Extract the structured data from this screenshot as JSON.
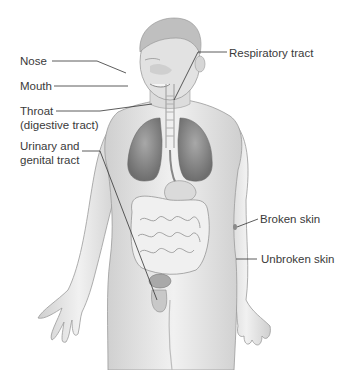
{
  "figure": {
    "labels": {
      "nose": "Nose",
      "mouth": "Mouth",
      "throat_line1": "Throat",
      "throat_line2": "(digestive tract)",
      "urinary_line1": "Urinary and",
      "urinary_line2": "genital tract",
      "respiratory": "Respiratory tract",
      "broken_skin": "Broken skin",
      "unbroken_skin": "Unbroken skin"
    },
    "colors": {
      "skin": "#e6e6e6",
      "skin_shadow": "#bdbdbd",
      "outline": "#8a8a8a",
      "lungs": "#8f8f8f",
      "intestine": "#efefef",
      "leader_line": "#333333",
      "text": "#3a3a3a"
    }
  }
}
